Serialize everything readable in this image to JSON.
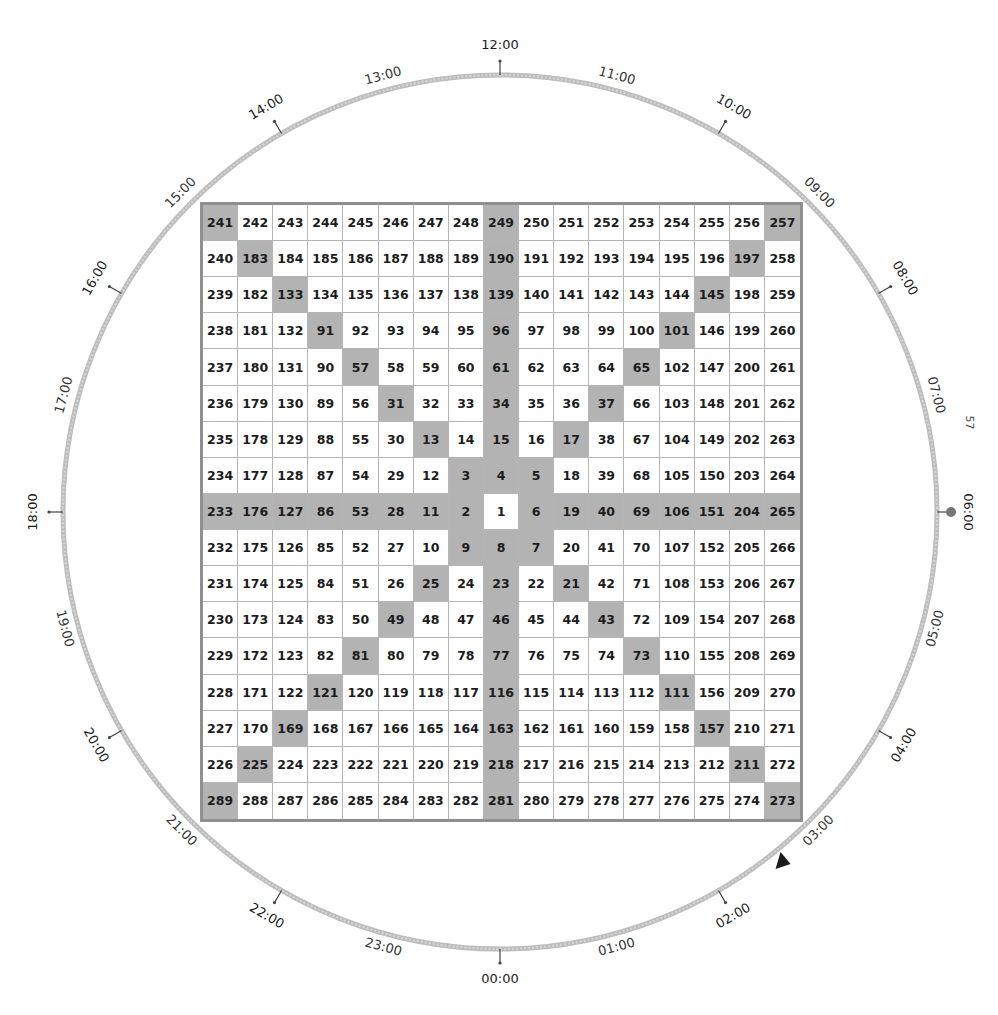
{
  "dial": {
    "center": [
      500,
      512
    ],
    "radius": 437,
    "ring_color": "#bdbdbd",
    "tick_color": "#444444",
    "hours": [
      {
        "label": "00:00",
        "hour": 0,
        "tick": true
      },
      {
        "label": "01:00",
        "hour": 1,
        "tick": false
      },
      {
        "label": "02:00",
        "hour": 2,
        "tick": true
      },
      {
        "label": "03:00",
        "hour": 3,
        "tick": false
      },
      {
        "label": "04:00",
        "hour": 4,
        "tick": true
      },
      {
        "label": "05:00",
        "hour": 5,
        "tick": false
      },
      {
        "label": "06:00",
        "hour": 6,
        "tick": true,
        "dot_marker": true
      },
      {
        "label": "07:00",
        "hour": 7,
        "tick": false
      },
      {
        "label": "08:00",
        "hour": 8,
        "tick": true
      },
      {
        "label": "09:00",
        "hour": 9,
        "tick": false
      },
      {
        "label": "10:00",
        "hour": 10,
        "tick": true
      },
      {
        "label": "11:00",
        "hour": 11,
        "tick": false
      },
      {
        "label": "12:00",
        "hour": 12,
        "tick": true
      },
      {
        "label": "13:00",
        "hour": 13,
        "tick": false
      },
      {
        "label": "14:00",
        "hour": 14,
        "tick": true
      },
      {
        "label": "15:00",
        "hour": 15,
        "tick": false
      },
      {
        "label": "16:00",
        "hour": 16,
        "tick": true
      },
      {
        "label": "17:00",
        "hour": 17,
        "tick": false
      },
      {
        "label": "18:00",
        "hour": 18,
        "tick": true
      },
      {
        "label": "19:00",
        "hour": 19,
        "tick": false
      },
      {
        "label": "20:00",
        "hour": 20,
        "tick": true
      },
      {
        "label": "21:00",
        "hour": 21,
        "tick": false
      },
      {
        "label": "22:00",
        "hour": 22,
        "tick": true
      },
      {
        "label": "23:00",
        "hour": 23,
        "tick": false
      }
    ],
    "triangle_marker": {
      "position_hour": 2.6,
      "color": "#1a1a1a",
      "icon": "triangle-pointer-icon"
    },
    "dot_marker": {
      "hour": 6,
      "color": "#777777",
      "icon": "dot-marker-icon"
    }
  },
  "stray_text": "57",
  "grid": {
    "size": 17,
    "highlight_color": "#b3b3b3",
    "rows": [
      [
        241,
        242,
        243,
        244,
        245,
        246,
        247,
        248,
        249,
        250,
        251,
        252,
        253,
        254,
        255,
        256,
        257
      ],
      [
        240,
        183,
        184,
        185,
        186,
        187,
        188,
        189,
        190,
        191,
        192,
        193,
        194,
        195,
        196,
        197,
        258
      ],
      [
        239,
        182,
        133,
        134,
        135,
        136,
        137,
        138,
        139,
        140,
        141,
        142,
        143,
        144,
        145,
        198,
        259
      ],
      [
        238,
        181,
        132,
        91,
        92,
        93,
        94,
        95,
        96,
        97,
        98,
        99,
        100,
        101,
        146,
        199,
        260
      ],
      [
        237,
        180,
        131,
        90,
        57,
        58,
        59,
        60,
        61,
        62,
        63,
        64,
        65,
        102,
        147,
        200,
        261
      ],
      [
        236,
        179,
        130,
        89,
        56,
        31,
        32,
        33,
        34,
        35,
        36,
        37,
        66,
        103,
        148,
        201,
        262
      ],
      [
        235,
        178,
        129,
        88,
        55,
        30,
        13,
        14,
        15,
        16,
        17,
        38,
        67,
        104,
        149,
        202,
        263
      ],
      [
        234,
        177,
        128,
        87,
        54,
        29,
        12,
        3,
        4,
        5,
        18,
        39,
        68,
        105,
        150,
        203,
        264
      ],
      [
        233,
        176,
        127,
        86,
        53,
        28,
        11,
        2,
        1,
        6,
        19,
        40,
        69,
        106,
        151,
        204,
        265
      ],
      [
        232,
        175,
        126,
        85,
        52,
        27,
        10,
        9,
        8,
        7,
        20,
        41,
        70,
        107,
        152,
        205,
        266
      ],
      [
        231,
        174,
        125,
        84,
        51,
        26,
        25,
        24,
        23,
        22,
        21,
        42,
        71,
        108,
        153,
        206,
        267
      ],
      [
        230,
        173,
        124,
        83,
        50,
        49,
        48,
        47,
        46,
        45,
        44,
        43,
        72,
        109,
        154,
        207,
        268
      ],
      [
        229,
        172,
        123,
        82,
        81,
        80,
        79,
        78,
        77,
        76,
        75,
        74,
        73,
        110,
        155,
        208,
        269
      ],
      [
        228,
        171,
        122,
        121,
        120,
        119,
        118,
        117,
        116,
        115,
        114,
        113,
        112,
        111,
        156,
        209,
        270
      ],
      [
        227,
        170,
        169,
        168,
        167,
        166,
        165,
        164,
        163,
        162,
        161,
        160,
        159,
        158,
        157,
        210,
        271
      ],
      [
        226,
        225,
        224,
        223,
        222,
        221,
        220,
        219,
        218,
        217,
        216,
        215,
        214,
        213,
        212,
        211,
        272
      ],
      [
        289,
        288,
        287,
        286,
        285,
        284,
        283,
        282,
        281,
        280,
        279,
        278,
        277,
        276,
        275,
        274,
        273
      ]
    ],
    "highlighted_rule": "main diagonals, center row, center column (except center cell)"
  }
}
